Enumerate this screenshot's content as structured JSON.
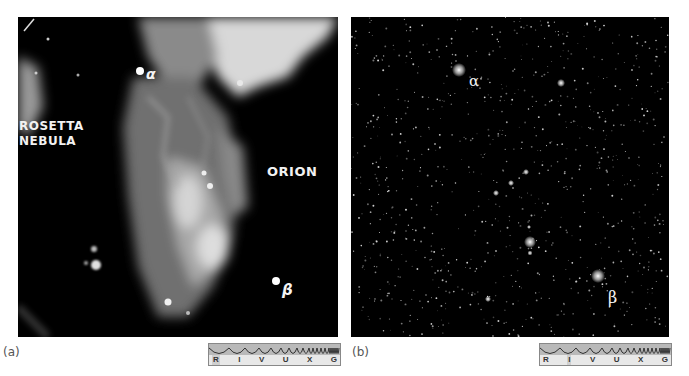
{
  "figure": {
    "panel_a": {
      "caption": "(a)",
      "labels": {
        "nebula_line1": "ROSETTA",
        "nebula_line2": "NEBULA",
        "constellation": "ORION",
        "alpha": "α",
        "beta": "β"
      },
      "spectrum_bar": {
        "bands": [
          "R",
          "I",
          "V",
          "U",
          "X",
          "G"
        ],
        "highlighted": "R"
      }
    },
    "panel_b": {
      "caption": "(b)",
      "labels": {
        "alpha": "α",
        "beta": "β"
      },
      "spectrum_bar": {
        "bands": [
          "R",
          "I",
          "V",
          "U",
          "X",
          "G"
        ],
        "highlighted": "I"
      }
    }
  }
}
